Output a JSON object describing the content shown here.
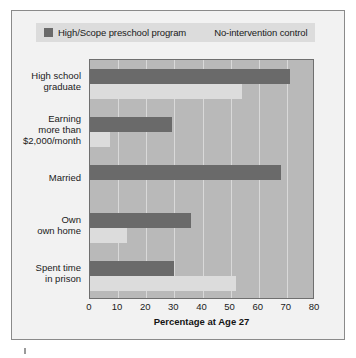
{
  "chart_data": {
    "type": "bar",
    "orientation": "horizontal",
    "title": "",
    "xlabel": "Percentage at Age 27",
    "ylabel": "",
    "xlim": [
      0,
      80
    ],
    "xticks": [
      0,
      10,
      20,
      30,
      40,
      50,
      60,
      70,
      80
    ],
    "grid": true,
    "legend_position": "top-left",
    "categories": [
      "High school graduate",
      "Earning more than $2,000/month",
      "Married",
      "Own own home",
      "Spent time in prison"
    ],
    "category_lines": [
      [
        "High school",
        "graduate"
      ],
      [
        "Earning",
        "more than",
        "$2,000/month"
      ],
      [
        "Married"
      ],
      [
        "Own",
        "own home"
      ],
      [
        "Spent time",
        "in prison"
      ]
    ],
    "series": [
      {
        "name": "High/Scope preschool program",
        "color": "#6a6a6a",
        "values": [
          71,
          29,
          68,
          36,
          30
        ]
      },
      {
        "name": "No-intervention control",
        "color": "#dcdcdc",
        "values": [
          54,
          7,
          0,
          13,
          52
        ]
      }
    ]
  },
  "legend": {
    "items": [
      {
        "label": "High/Scope preschool program",
        "color": "#6a6a6a"
      },
      {
        "label": "No-intervention control",
        "color": "#dcdcdc"
      }
    ]
  },
  "axis": {
    "x_title": "Percentage at Age 27",
    "tick_labels": [
      "0",
      "10",
      "20",
      "30",
      "40",
      "50",
      "60",
      "70",
      "80"
    ]
  },
  "colors": {
    "figure_background": "#f2f2f2",
    "plot_background": "#b9b9b9",
    "gridline": "#d9d9d9",
    "border": "#8a8a8a",
    "text": "#1a1a1a"
  }
}
